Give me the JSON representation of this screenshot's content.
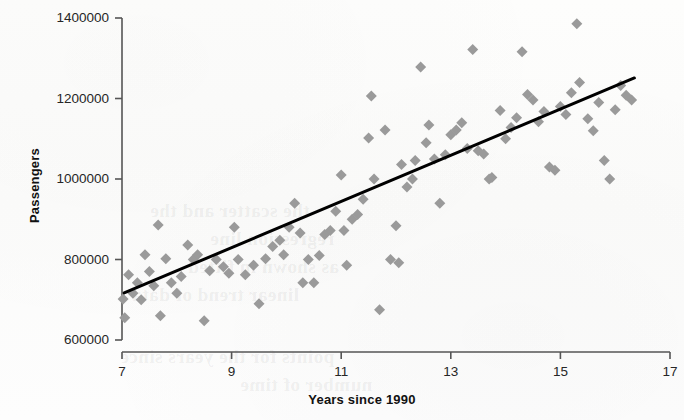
{
  "chart_data": {
    "type": "scatter",
    "title": "",
    "xlabel": "Years since 1990",
    "ylabel": "Passengers",
    "xlim": [
      7,
      17
    ],
    "ylim": [
      600000,
      1400000
    ],
    "grid": false,
    "legend": "none",
    "marker": {
      "shape": "diamond",
      "color": "#9a9a9a",
      "size_px": 11
    },
    "xticks": [
      "7",
      "9",
      "11",
      "13",
      "15",
      "17"
    ],
    "xtick_values": [
      7,
      9,
      11,
      13,
      15,
      17
    ],
    "yticks": [
      "600000",
      "800000",
      "1000000",
      "1200000",
      "1400000"
    ],
    "ytick_values": [
      600000,
      800000,
      1000000,
      1200000,
      1400000
    ],
    "trendline": {
      "type": "linear",
      "color": "#000000",
      "width_px": 3,
      "x_start": 7.04,
      "y_start": 717000,
      "x_end": 16.35,
      "y_end": 1251000
    },
    "points": [
      [
        7.02,
        702000
      ],
      [
        7.05,
        655000
      ],
      [
        7.12,
        762000
      ],
      [
        7.2,
        716000
      ],
      [
        7.28,
        742000
      ],
      [
        7.35,
        700000
      ],
      [
        7.42,
        812000
      ],
      [
        7.5,
        770000
      ],
      [
        7.58,
        735000
      ],
      [
        7.66,
        886000
      ],
      [
        7.7,
        660000
      ],
      [
        7.8,
        802000
      ],
      [
        7.9,
        742000
      ],
      [
        8.0,
        716000
      ],
      [
        8.08,
        758000
      ],
      [
        8.2,
        836000
      ],
      [
        8.3,
        800000
      ],
      [
        8.38,
        812000
      ],
      [
        8.5,
        648000
      ],
      [
        8.6,
        772000
      ],
      [
        8.72,
        800000
      ],
      [
        8.85,
        782000
      ],
      [
        8.95,
        766000
      ],
      [
        9.05,
        880000
      ],
      [
        9.12,
        800000
      ],
      [
        9.25,
        762000
      ],
      [
        9.4,
        786000
      ],
      [
        9.5,
        690000
      ],
      [
        9.62,
        802000
      ],
      [
        9.75,
        832000
      ],
      [
        9.88,
        848000
      ],
      [
        9.95,
        812000
      ],
      [
        10.05,
        880000
      ],
      [
        10.15,
        940000
      ],
      [
        10.25,
        866000
      ],
      [
        10.3,
        742000
      ],
      [
        10.4,
        800000
      ],
      [
        10.5,
        742000
      ],
      [
        10.6,
        810000
      ],
      [
        10.7,
        862000
      ],
      [
        10.8,
        872000
      ],
      [
        10.9,
        920000
      ],
      [
        11.0,
        1010000
      ],
      [
        11.05,
        872000
      ],
      [
        11.1,
        786000
      ],
      [
        11.2,
        900000
      ],
      [
        11.3,
        912000
      ],
      [
        11.4,
        950000
      ],
      [
        11.5,
        1102000
      ],
      [
        11.55,
        1206000
      ],
      [
        11.6,
        1000000
      ],
      [
        11.7,
        675000
      ],
      [
        11.8,
        1122000
      ],
      [
        11.9,
        800000
      ],
      [
        12.0,
        884000
      ],
      [
        12.05,
        792000
      ],
      [
        12.1,
        1036000
      ],
      [
        12.2,
        980000
      ],
      [
        12.3,
        1000000
      ],
      [
        12.35,
        1046000
      ],
      [
        12.45,
        1278000
      ],
      [
        12.55,
        1090000
      ],
      [
        12.6,
        1134000
      ],
      [
        12.7,
        1050000
      ],
      [
        12.8,
        940000
      ],
      [
        12.9,
        1060000
      ],
      [
        13.0,
        1110000
      ],
      [
        13.1,
        1122000
      ],
      [
        13.2,
        1140000
      ],
      [
        13.3,
        1076000
      ],
      [
        13.4,
        1322000
      ],
      [
        13.5,
        1070000
      ],
      [
        13.6,
        1062000
      ],
      [
        13.7,
        1000000
      ],
      [
        13.75,
        1004000
      ],
      [
        13.9,
        1170000
      ],
      [
        14.0,
        1100000
      ],
      [
        14.1,
        1128000
      ],
      [
        14.2,
        1152000
      ],
      [
        14.3,
        1316000
      ],
      [
        14.4,
        1210000
      ],
      [
        14.5,
        1196000
      ],
      [
        14.6,
        1142000
      ],
      [
        14.7,
        1168000
      ],
      [
        14.8,
        1030000
      ],
      [
        14.9,
        1022000
      ],
      [
        15.0,
        1180000
      ],
      [
        15.1,
        1160000
      ],
      [
        15.2,
        1214000
      ],
      [
        15.3,
        1386000
      ],
      [
        15.35,
        1240000
      ],
      [
        15.5,
        1150000
      ],
      [
        15.6,
        1120000
      ],
      [
        15.7,
        1190000
      ],
      [
        15.8,
        1046000
      ],
      [
        15.9,
        1000000
      ],
      [
        16.0,
        1172000
      ],
      [
        16.1,
        1232000
      ],
      [
        16.2,
        1208000
      ],
      [
        16.3,
        1196000
      ]
    ]
  },
  "axes": {
    "y_label": "Passengers",
    "x_label": "Years since 1990"
  },
  "bleed_text": [
    "the scatter and the",
    "regression line",
    "as shown in fitted",
    "linear trend of data",
    "points for the years since",
    "number of time"
  ]
}
